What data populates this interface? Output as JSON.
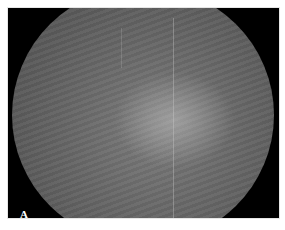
{
  "figure": {
    "panel_label": "A",
    "image_description": "Grayscale fundus photograph within black circular mask",
    "colors": {
      "background": "#ffffff",
      "frame": "#000000",
      "fundus_gray": "#666666",
      "label": "#ffffff"
    }
  }
}
